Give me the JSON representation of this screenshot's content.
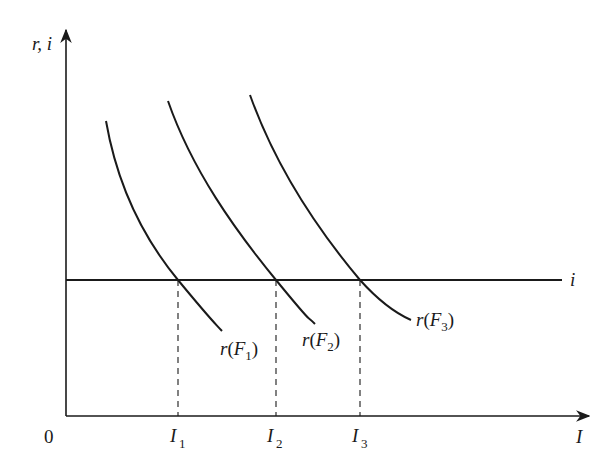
{
  "diagram": {
    "y_axis_label": "r, i",
    "x_axis_label": "I",
    "origin_label": "0",
    "horizontal_line_label": "i",
    "curves": [
      {
        "name": "r",
        "paren_open": "(",
        "var": "F",
        "sub": "1",
        "paren_close": ")"
      },
      {
        "name": "r",
        "paren_open": "(",
        "var": "F",
        "sub": "2",
        "paren_close": ")"
      },
      {
        "name": "r",
        "paren_open": "(",
        "var": "F",
        "sub": "3",
        "paren_close": ")"
      }
    ],
    "x_ticks": [
      {
        "var": "I",
        "sub": "1"
      },
      {
        "var": "I",
        "sub": "2"
      },
      {
        "var": "I",
        "sub": "3"
      }
    ]
  },
  "colors": {
    "ink": "#1a1a1a",
    "background": "#ffffff"
  }
}
